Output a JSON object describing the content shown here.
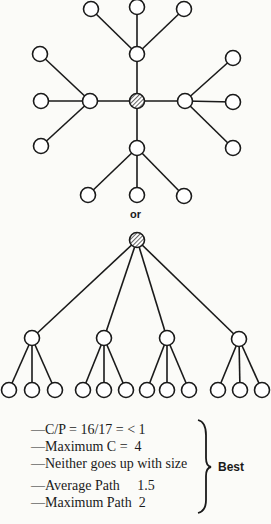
{
  "separator_label": "or",
  "star_network": {
    "center": {
      "id": "center",
      "hatched": true
    },
    "hubs": [
      "top",
      "left",
      "right",
      "bottom"
    ],
    "leaves_per_hub": 3
  },
  "tree_network": {
    "root": {
      "id": "root",
      "hatched": true
    },
    "second_level_count": 4,
    "leaves_per_node": 3
  },
  "stats": {
    "lines": [
      "—C/P = 16/17 = < 1",
      "—Maximum C =  4",
      "—Neither goes up with size",
      "—Average Path     1.5",
      "—Maximum Path  2"
    ],
    "verdict": "Best"
  }
}
